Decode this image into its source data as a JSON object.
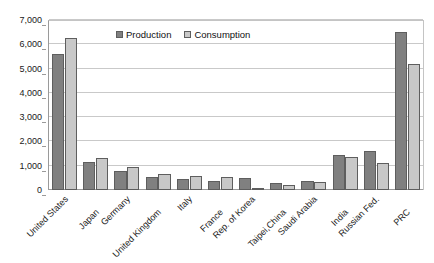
{
  "chart_data": {
    "type": "bar",
    "title": "",
    "xlabel": "",
    "ylabel": "",
    "ylim": [
      0,
      7000
    ],
    "grid": true,
    "legend_position": "top-center-inside",
    "categories": [
      "United States",
      "Japan",
      "Germany",
      "United Kingdom",
      "Italy",
      "France",
      "Rep. of Korea",
      "Taipei,China",
      "Saudi Arabia",
      "India",
      "Russian Fed.",
      "PRC"
    ],
    "series": [
      {
        "name": "Production",
        "color": "#808080",
        "values": [
          5600,
          1150,
          800,
          520,
          450,
          380,
          510,
          270,
          390,
          1430,
          1590,
          6500
        ]
      },
      {
        "name": "Consumption",
        "color": "#c8c8c8",
        "values": [
          6250,
          1300,
          930,
          680,
          590,
          550,
          60,
          195,
          330,
          1350,
          1110,
          5200
        ]
      }
    ],
    "ytick_labels": [
      "0",
      "1,000",
      "2,000",
      "3,000",
      "4,000",
      "5,000",
      "6,000",
      "7,000"
    ],
    "ytick_values": [
      0,
      1000,
      2000,
      3000,
      4000,
      5000,
      6000,
      7000
    ]
  },
  "legend": {
    "entries": [
      {
        "label": "Production",
        "swatch": "production-swatch-icon"
      },
      {
        "label": "Consumption",
        "swatch": "consumption-swatch-icon"
      }
    ]
  }
}
